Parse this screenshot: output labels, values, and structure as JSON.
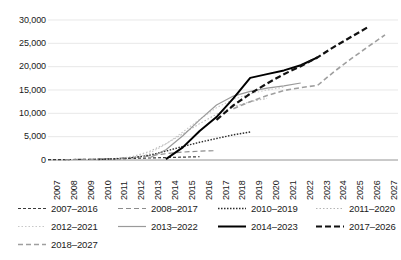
{
  "chart_data": {
    "type": "line",
    "title": "",
    "xlabel": "",
    "ylabel": "",
    "grid": true,
    "legend_position": "bottom",
    "ylim": [
      0,
      30000
    ],
    "yticks": [
      0,
      5000,
      10000,
      15000,
      20000,
      25000,
      30000
    ],
    "ytick_labels": [
      "0",
      "5,000",
      "10,000",
      "15,000",
      "20,000",
      "25,000",
      "30,000"
    ],
    "x": [
      2007,
      2008,
      2009,
      2010,
      2011,
      2012,
      2013,
      2014,
      2015,
      2016,
      2017,
      2018,
      2019,
      2020,
      2021,
      2022,
      2023,
      2024,
      2025,
      2026,
      2027
    ],
    "xtick_labels": [
      "2007",
      "2008",
      "2009",
      "2010",
      "2011",
      "2012",
      "2013",
      "2014",
      "2015",
      "2016",
      "2017",
      "2018",
      "2019",
      "2020",
      "2021",
      "2022",
      "2023",
      "2024",
      "2025",
      "2026",
      "2027"
    ],
    "series": [
      {
        "name": "2007–2016",
        "style": "dashed-fine",
        "color": "#3b3b3b",
        "x": [
          2007,
          2008,
          2009,
          2010,
          2011,
          2012,
          2013,
          2014,
          2015,
          2016
        ],
        "values": [
          60,
          90,
          130,
          180,
          250,
          340,
          430,
          520,
          610,
          700
        ]
      },
      {
        "name": "2008–2017",
        "style": "dashed-coarse",
        "color": "#8c8c8c",
        "x": [
          2008,
          2009,
          2010,
          2011,
          2012,
          2013,
          2014,
          2015,
          2016,
          2017
        ],
        "values": [
          80,
          130,
          200,
          320,
          520,
          900,
          1350,
          1700,
          1900,
          2000
        ]
      },
      {
        "name": "2010–2019",
        "style": "dotted",
        "color": "#2b2b2b",
        "x": [
          2010,
          2011,
          2012,
          2013,
          2014,
          2015,
          2016,
          2017,
          2018,
          2019
        ],
        "values": [
          120,
          260,
          500,
          1000,
          1900,
          2900,
          3800,
          4600,
          5400,
          6000
        ]
      },
      {
        "name": "2011–2020",
        "style": "dotted-light",
        "color": "#b5b5b5",
        "x": [
          2011,
          2012,
          2013,
          2014,
          2015,
          2016,
          2017,
          2018,
          2019,
          2020
        ],
        "values": [
          200,
          700,
          1800,
          3500,
          5600,
          7800,
          9800,
          11400,
          12500,
          13200
        ]
      },
      {
        "name": "2012–2021",
        "style": "dotted-pale",
        "color": "#c8c8c8",
        "x": [
          2012,
          2013,
          2014,
          2015,
          2016,
          2017,
          2018,
          2019,
          2020,
          2021
        ],
        "values": [
          300,
          1400,
          3400,
          6000,
          8700,
          11200,
          13000,
          14200,
          15000,
          15600
        ]
      },
      {
        "name": "2013–2022",
        "style": "solid-gray",
        "color": "#9a9a9a",
        "x": [
          2013,
          2014,
          2015,
          2016,
          2017,
          2018,
          2019,
          2020,
          2021,
          2022
        ],
        "values": [
          400,
          2200,
          5200,
          8600,
          11800,
          13700,
          14700,
          15400,
          15900,
          16500
        ]
      },
      {
        "name": "2014–2023",
        "style": "solid-black",
        "color": "#000000",
        "x": [
          2014,
          2015,
          2016,
          2017,
          2018,
          2019,
          2020,
          2021,
          2022,
          2023
        ],
        "values": [
          200,
          2700,
          6200,
          9200,
          13200,
          17600,
          18400,
          19200,
          20300,
          22000
        ]
      },
      {
        "name": "2017–2026",
        "style": "dashed-black-bold",
        "color": "#111111",
        "x": [
          2017,
          2018,
          2019,
          2020,
          2021,
          2022,
          2023,
          2024,
          2025,
          2026
        ],
        "values": [
          8600,
          11700,
          14200,
          16400,
          18400,
          20100,
          22000,
          24300,
          26400,
          28500
        ]
      },
      {
        "name": "2018–2027",
        "style": "dashed-gray",
        "color": "#9f9f9f",
        "x": [
          2018,
          2019,
          2020,
          2021,
          2022,
          2023,
          2024,
          2025,
          2026,
          2027
        ],
        "values": [
          11000,
          12500,
          13800,
          14900,
          15500,
          16000,
          19000,
          21700,
          24300,
          26800
        ]
      }
    ],
    "legend_rows": [
      [
        "2007–2016",
        "2008–2017",
        "2010–2019",
        "2011–2020"
      ],
      [
        "2012–2021",
        "2013–2022",
        "2014–2023",
        "2017–2026"
      ],
      [
        "2018–2027"
      ]
    ]
  }
}
